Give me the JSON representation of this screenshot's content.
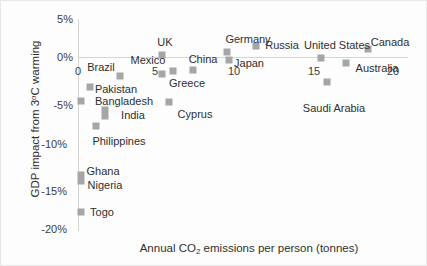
{
  "chart_data": {
    "type": "scatter",
    "title": "",
    "xlabel": "Annual CO2 emissions per person (tonnes)",
    "ylabel": "GDP impact from 3°C warming",
    "xlim": [
      -0.9,
      21.0
    ],
    "ylim": [
      -20,
      5
    ],
    "xticks": [
      0,
      5,
      10,
      15,
      20
    ],
    "xtick_labels": [
      "0",
      "5",
      "10",
      "15",
      "20"
    ],
    "yticks": [
      5,
      0,
      -5,
      -10,
      -15,
      -20
    ],
    "ytick_labels": [
      "5%",
      "0%",
      "-5%",
      "-10%",
      "-15%",
      "-20%"
    ],
    "grid": false,
    "legend": "none",
    "marker_color": "#a6a6a6",
    "points": [
      {
        "name": "Togo",
        "x": 0.2,
        "y": -18.4
      },
      {
        "name": "Nigeria",
        "x": 0.2,
        "y": -14.2
      },
      {
        "name": "Ghana",
        "x": 0.2,
        "y": -13.2
      },
      {
        "name": "Bangladesh",
        "x": 0.2,
        "y": -5.2
      },
      {
        "name": "Philippines",
        "x": 1.2,
        "y": -7.6
      },
      {
        "name": "India",
        "x": 1.7,
        "y": -6.8
      },
      {
        "name": "Pakistan",
        "x": 0.8,
        "y": -2.4
      },
      {
        "name": "Brazil",
        "x": 2.7,
        "y": -1.8
      },
      {
        "name": "Mexico",
        "x": 5.3,
        "y": -1.2
      },
      {
        "name": "UK",
        "x": 5.3,
        "y": 0.3
      },
      {
        "name": "Greece",
        "x": 6.0,
        "y": -1.1
      },
      {
        "name": "Cyprus",
        "x": 5.8,
        "y": -4.6
      },
      {
        "name": "China",
        "x": 7.3,
        "y": -1.0
      },
      {
        "name": "Germany",
        "x": 9.4,
        "y": 0.7
      },
      {
        "name": "Japan",
        "x": 9.5,
        "y": -0.3
      },
      {
        "name": "Russia",
        "x": 11.2,
        "y": 1.4
      },
      {
        "name": "United States",
        "x": 15.4,
        "y": 0.0
      },
      {
        "name": "Saudi Arabia",
        "x": 15.8,
        "y": -3.2
      },
      {
        "name": "Australia",
        "x": 17.0,
        "y": -0.7
      },
      {
        "name": "Canada",
        "x": 18.4,
        "y": 1.4
      }
    ]
  },
  "markers": [
    {
      "id": "togo",
      "left": 80,
      "top": 211,
      "tall": false
    },
    {
      "id": "ghana-nigeria",
      "left": 80,
      "top": 177,
      "tall": true
    },
    {
      "id": "bangladesh",
      "left": 80,
      "top": 100,
      "tall": false
    },
    {
      "id": "philippines",
      "left": 95,
      "top": 125,
      "tall": false
    },
    {
      "id": "india",
      "left": 104,
      "top": 112,
      "tall": true
    },
    {
      "id": "pakistan",
      "left": 89,
      "top": 86,
      "tall": false
    },
    {
      "id": "brazil",
      "left": 119,
      "top": 75,
      "tall": false
    },
    {
      "id": "mexico",
      "left": 161,
      "top": 73,
      "tall": false
    },
    {
      "id": "uk",
      "left": 161,
      "top": 54,
      "tall": false
    },
    {
      "id": "greece",
      "left": 172,
      "top": 70,
      "tall": false
    },
    {
      "id": "cyprus",
      "left": 168,
      "top": 101,
      "tall": false
    },
    {
      "id": "china",
      "left": 192,
      "top": 69,
      "tall": false
    },
    {
      "id": "germany",
      "left": 226,
      "top": 51,
      "tall": false
    },
    {
      "id": "japan",
      "left": 228,
      "top": 59,
      "tall": false
    },
    {
      "id": "russia",
      "left": 255,
      "top": 45,
      "tall": false
    },
    {
      "id": "united-states",
      "left": 320,
      "top": 57,
      "tall": false
    },
    {
      "id": "saudi-arabia",
      "left": 326,
      "top": 81,
      "tall": false
    },
    {
      "id": "australia",
      "left": 345,
      "top": 62,
      "tall": false
    },
    {
      "id": "canada",
      "left": 367,
      "top": 48,
      "tall": false
    }
  ],
  "point_labels": [
    {
      "text": "Togo",
      "left": 101,
      "top": 211
    },
    {
      "text": "Ghana",
      "left": 102,
      "top": 170
    },
    {
      "text": "Nigeria",
      "left": 104,
      "top": 184
    },
    {
      "text": "Bangladesh",
      "left": 123,
      "top": 100
    },
    {
      "text": "Philippines",
      "left": 118,
      "top": 140
    },
    {
      "text": "India",
      "left": 132,
      "top": 114
    },
    {
      "text": "Pakistan",
      "left": 115,
      "top": 88
    },
    {
      "text": "Brazil",
      "left": 100,
      "top": 66
    },
    {
      "text": "Mexico",
      "left": 147,
      "top": 59
    },
    {
      "text": "UK",
      "left": 164,
      "top": 41
    },
    {
      "text": "Greece",
      "left": 186,
      "top": 82
    },
    {
      "text": "Cyprus",
      "left": 194,
      "top": 113
    },
    {
      "text": "China",
      "left": 202,
      "top": 58
    },
    {
      "text": "Germany",
      "left": 247,
      "top": 38
    },
    {
      "text": "Japan",
      "left": 248,
      "top": 62
    },
    {
      "text": "Russia",
      "left": 281,
      "top": 44
    },
    {
      "text": "United States",
      "left": 336,
      "top": 44
    },
    {
      "text": "Saudi Arabia",
      "left": 333,
      "top": 107
    },
    {
      "text": "Australia",
      "left": 376,
      "top": 67
    },
    {
      "text": "Canada",
      "left": 389,
      "top": 41
    }
  ],
  "ytick_positions": [
    {
      "label": "5%",
      "left": 38,
      "top": 18
    },
    {
      "label": "0%",
      "left": 38,
      "top": 56
    },
    {
      "label": "-5%",
      "left": 38,
      "top": 104
    },
    {
      "label": "-10%",
      "left": 32,
      "top": 143
    },
    {
      "label": "-15%",
      "left": 32,
      "top": 190
    },
    {
      "label": "-20%",
      "left": 32,
      "top": 228
    }
  ],
  "xtick_positions": [
    {
      "label": "0",
      "left": 77,
      "top": 70
    },
    {
      "label": "5",
      "left": 154,
      "top": 70
    },
    {
      "label": "10",
      "left": 233,
      "top": 70
    },
    {
      "label": "15",
      "left": 313,
      "top": 70
    },
    {
      "label": "20",
      "left": 392,
      "top": 70
    }
  ],
  "axis_titles": {
    "x_prefix": "Annual CO",
    "x_sub": "2",
    "x_suffix": " emissions per person (tonnes)",
    "y_prefix": "GDP impact from 3",
    "y_sup": "o",
    "y_suffix": "C warming"
  }
}
